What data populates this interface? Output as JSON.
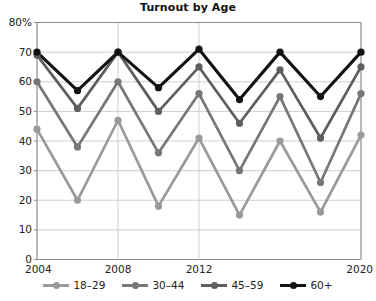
{
  "chart_data": {
    "type": "line",
    "title": "Turnout by Age",
    "xlabel": "",
    "ylabel": "",
    "grid": true,
    "legend_position": "bottom",
    "x": [
      2004,
      2006,
      2008,
      2010,
      2012,
      2014,
      2016,
      2018,
      2020
    ],
    "xtick_labels": [
      "2004",
      "2008",
      "2012",
      "2020"
    ],
    "xtick_values": [
      2004,
      2008,
      2012,
      2020
    ],
    "ytick_labels": [
      "0",
      "10",
      "20",
      "30",
      "40",
      "50",
      "60",
      "70",
      "80%"
    ],
    "ytick_values": [
      0,
      10,
      20,
      30,
      40,
      50,
      60,
      70,
      80
    ],
    "ylim": [
      0,
      80
    ],
    "series": [
      {
        "name": "18–29",
        "color": "#9a9a9a",
        "values": [
          44,
          20,
          47,
          18,
          41,
          15,
          40,
          16,
          42
        ]
      },
      {
        "name": "30–44",
        "color": "#777777",
        "values": [
          60,
          38,
          60,
          36,
          56,
          30,
          55,
          26,
          56
        ]
      },
      {
        "name": "45–59",
        "color": "#5e5e5e",
        "values": [
          69,
          51,
          70,
          50,
          65,
          46,
          64,
          41,
          65
        ]
      },
      {
        "name": "60+",
        "color": "#121212",
        "values": [
          70,
          57,
          70,
          58,
          71,
          54,
          70,
          55,
          70
        ]
      }
    ]
  },
  "axes": {
    "axis_color": "#8c8c8c",
    "grid_color": "#c9c9c9"
  }
}
